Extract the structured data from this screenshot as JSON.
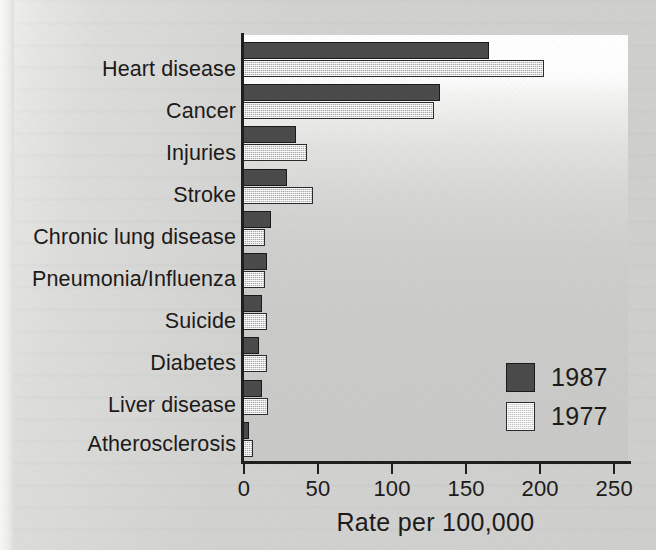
{
  "chart_data": {
    "type": "bar",
    "orientation": "horizontal",
    "title": "",
    "xlabel": "Rate per 100,000",
    "ylabel": "",
    "xlim": [
      0,
      260
    ],
    "xticks": [
      0,
      50,
      100,
      150,
      200,
      250
    ],
    "xtick_labels": [
      "0",
      "50",
      "100",
      "150",
      "200",
      "250"
    ],
    "grid": false,
    "legend_position": "inside-bottom-right",
    "categories": [
      "Heart disease",
      "Cancer",
      "Injuries",
      "Stroke",
      "Chronic lung disease",
      "Pneumonia/Influenza",
      "Suicide",
      "Diabetes",
      "Liver disease",
      "Atherosclerosis"
    ],
    "series": [
      {
        "name": "1987",
        "color": "#4b4b4b",
        "values": [
          166,
          133,
          36,
          30,
          19,
          16,
          13,
          11,
          13,
          4
        ]
      },
      {
        "name": "1977",
        "color": "#d2d2d2",
        "values": [
          203,
          129,
          43,
          47,
          15,
          15,
          16,
          16,
          17,
          7
        ]
      }
    ]
  },
  "axis": {
    "x_title": "Rate per 100,000"
  },
  "legend": {
    "entries": [
      {
        "label": "1987",
        "swatch": "dark-filled-square"
      },
      {
        "label": "1977",
        "swatch": "light-hatched-square"
      }
    ]
  }
}
